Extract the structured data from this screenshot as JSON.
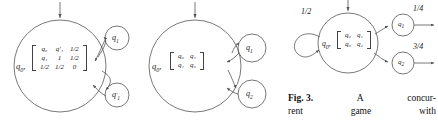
{
  "figure": {
    "caption": {
      "label": "Fig. 3.",
      "line1_words": [
        "A",
        "concur-"
      ],
      "line2_words": [
        "rent",
        "game",
        "with"
      ]
    }
  },
  "diagrams": [
    {
      "id": "diagram-1",
      "main_state": "q",
      "main_state_sub": "0",
      "matrix": {
        "rows": [
          [
            "q₀",
            "q′₁",
            "1/2"
          ],
          [
            "q₁",
            "1",
            "1/2"
          ],
          [
            "1/2",
            "1/2",
            "0"
          ]
        ]
      },
      "successor_states": [
        {
          "label": "q",
          "sub": "1",
          "prime": false
        },
        {
          "label": "q",
          "sub": "1",
          "prime": true
        }
      ]
    },
    {
      "id": "diagram-2",
      "main_state": "q",
      "main_state_sub": "0",
      "matrix": {
        "rows": [
          [
            "q₀",
            "q₁"
          ],
          [
            "q₁",
            "q₂"
          ]
        ]
      },
      "successor_states": [
        {
          "label": "q",
          "sub": "1",
          "prime": false
        },
        {
          "label": "q",
          "sub": "2",
          "prime": false
        }
      ]
    },
    {
      "id": "diagram-3",
      "main_state": "q",
      "main_state_sub": "0",
      "matrix": {
        "rows": [
          [
            "q₀",
            "q₁"
          ],
          [
            "q₀",
            "q₂"
          ]
        ]
      },
      "self_loop_label": "1/2",
      "successor_states": [
        {
          "label": "q",
          "sub": "1",
          "prime": false,
          "edge_label": "1/4"
        },
        {
          "label": "q",
          "sub": "2",
          "prime": false,
          "edge_label": "3/4"
        }
      ]
    }
  ],
  "colors": {
    "stroke": "#555555",
    "text": "#1a1a1a",
    "background": "#ffffff"
  }
}
